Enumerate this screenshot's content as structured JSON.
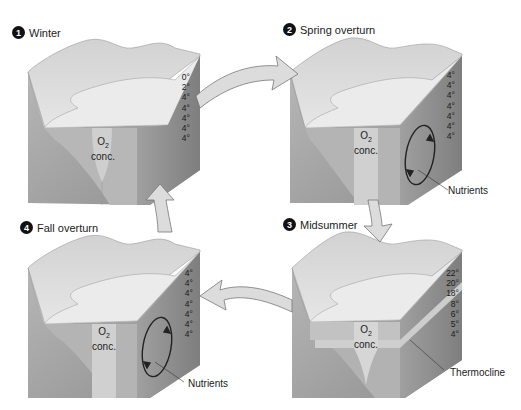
{
  "diagram": {
    "colors": {
      "ground_light": "#d9d9d9",
      "ground_mid": "#b5b5b5",
      "ground_dark": "#8e8e8e",
      "water_top": "#e8e8e8",
      "water_side": "#a9a9a9",
      "arrow_fill": "#dcdcdc",
      "arrow_stroke": "#777777"
    },
    "stages": [
      {
        "number": "1",
        "label": "Winter",
        "temperatures": [
          "0°",
          "2°",
          "4°",
          "4°",
          "4°",
          "4°",
          "4°"
        ],
        "o2_label": "O",
        "o2_sub": "2",
        "o2_conc": "conc.",
        "callout": "",
        "circulation": false
      },
      {
        "number": "2",
        "label": "Spring overturn",
        "temperatures": [
          "4°",
          "4°",
          "4°",
          "4°",
          "4°",
          "4°",
          "4°"
        ],
        "o2_label": "O",
        "o2_sub": "2",
        "o2_conc": "conc.",
        "callout": "Nutrients",
        "circulation": true
      },
      {
        "number": "3",
        "label": "Midsummer",
        "temperatures": [
          "22°",
          "20°",
          "18°",
          "8°",
          "6°",
          "5°",
          "4°"
        ],
        "o2_label": "O",
        "o2_sub": "2",
        "o2_conc": "conc.",
        "callout": "Thermocline",
        "circulation": false
      },
      {
        "number": "4",
        "label": "Fall overturn",
        "temperatures": [
          "4°",
          "4°",
          "4°",
          "4°",
          "4°",
          "4°",
          "4°"
        ],
        "o2_label": "O",
        "o2_sub": "2",
        "o2_conc": "conc.",
        "callout": "Nutrients",
        "circulation": true
      }
    ],
    "cycle_arrows": [
      {
        "from": "Winter",
        "to": "Spring overturn"
      },
      {
        "from": "Spring overturn",
        "to": "Midsummer"
      },
      {
        "from": "Midsummer",
        "to": "Fall overturn"
      },
      {
        "from": "Fall overturn",
        "to": "Winter"
      }
    ]
  }
}
